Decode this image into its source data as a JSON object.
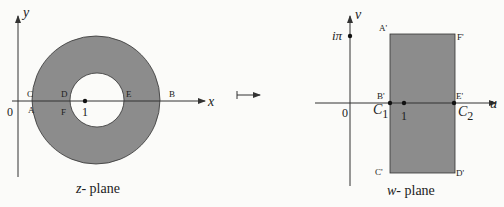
{
  "colors": {
    "region_fill": "#8c8c8c",
    "stroke": "#333333",
    "background": "#fbfbf9"
  },
  "z_plane": {
    "caption_var": "z",
    "caption_text": "- plane",
    "x_axis_label": "x",
    "y_axis_label": "y",
    "origin_label": "0",
    "point_one_label": "1",
    "points": {
      "A": "A",
      "B": "B",
      "C": "C",
      "D": "D",
      "E": "E",
      "F": "F"
    }
  },
  "mapping_arrow": "↦",
  "w_plane": {
    "caption_var": "w",
    "caption_text": "- plane",
    "u_axis_label": "u",
    "v_axis_label": "v",
    "origin_label": "0",
    "i_pi_label": "iπ",
    "point_one_label": "1",
    "c1_label": "C",
    "c1_sub": "1",
    "c2_label": "C",
    "c2_sub": "2",
    "points": {
      "A": "A'",
      "B": "B'",
      "C": "C'",
      "D": "D'",
      "E": "E'",
      "F": "F'"
    }
  }
}
